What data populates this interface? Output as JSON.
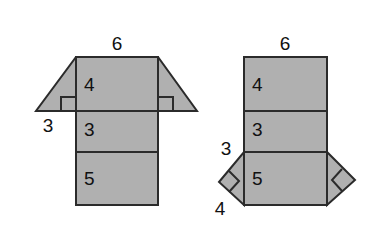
{
  "diagram": {
    "background_color": "#ffffff",
    "face_fill_color": "#b0b0b0",
    "edge_color": "#2b2b2b",
    "label_color": "#111111",
    "figures": [
      {
        "name": "left-net",
        "description": "Vertical strip of three rectangles with a trapezoid flap across the top rectangle",
        "labels": {
          "top_width": "6",
          "flap_height": "3",
          "rect_top": "4",
          "rect_middle": "3",
          "rect_bottom": "5"
        }
      },
      {
        "name": "right-net",
        "description": "Vertical strip of three rectangles with two triangular flaps on the bottom rectangle",
        "labels": {
          "top_width": "6",
          "flap_side": "3",
          "flap_base": "4",
          "rect_top": "4",
          "rect_middle": "3",
          "rect_bottom": "5"
        }
      }
    ]
  }
}
